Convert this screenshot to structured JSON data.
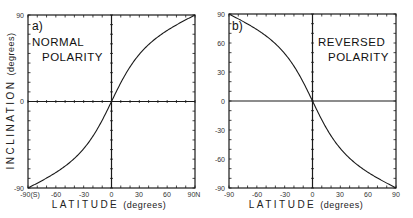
{
  "chart_data": [
    {
      "type": "line",
      "panel_label": "a)",
      "title_line1": "NORMAL",
      "title_line2": "POLARITY",
      "xlabel": "LATITUDE",
      "xlabel_unit": "(degrees)",
      "ylabel": "INCLINATION",
      "ylabel_unit": "(degrees)",
      "xlim": [
        -90,
        90
      ],
      "ylim": [
        -90,
        90
      ],
      "x_ticks": [
        "-90(S)",
        "-60",
        "-30",
        "0",
        "30",
        "60",
        "90N"
      ],
      "y_ticks": [
        "90",
        "0",
        "-90"
      ],
      "relation": "tan(I) = 2 tan(latitude)",
      "x": [
        -90,
        -75,
        -60,
        -45,
        -30,
        -15,
        0,
        15,
        30,
        45,
        60,
        75,
        90
      ],
      "y": [
        -90,
        -82.4,
        -73.9,
        -63.4,
        -49.1,
        -28.2,
        0,
        28.2,
        49.1,
        63.4,
        73.9,
        82.4,
        90
      ]
    },
    {
      "type": "line",
      "panel_label": "b)",
      "title_line1": "REVERSED",
      "title_line2": "POLARITY",
      "xlabel": "LATITUDE",
      "xlabel_unit": "(degrees)",
      "xlim": [
        -90,
        90
      ],
      "ylim": [
        -90,
        90
      ],
      "x_ticks": [
        "-90",
        "-60",
        "-30",
        "0",
        "30",
        "60",
        "90"
      ],
      "y_ticks": [
        "90",
        "60",
        "30",
        "0",
        "-30",
        "-60",
        "-90"
      ],
      "relation": "tan(I) = -2 tan(latitude)",
      "x": [
        -90,
        -75,
        -60,
        -45,
        -30,
        -15,
        0,
        15,
        30,
        45,
        60,
        75,
        90
      ],
      "y": [
        90,
        82.4,
        73.9,
        63.4,
        49.1,
        28.2,
        0,
        -28.2,
        -49.1,
        -63.4,
        -73.9,
        -82.4,
        -90
      ]
    }
  ],
  "left": {
    "panel_label": "a)",
    "title_line1": "NORMAL",
    "title_line2": "POLARITY",
    "ylabel": "INCLINATION",
    "ylabel_unit": "(degrees)",
    "xlabel": "LATITUDE",
    "xlabel_unit": "(degrees)",
    "y_ticks": [
      "90",
      "0",
      "-90"
    ],
    "x_ticks": [
      "-90(S)",
      "-60",
      "-30",
      "0",
      "30",
      "60",
      "90N"
    ]
  },
  "right": {
    "panel_label": "b)",
    "title_line1": "REVERSED",
    "title_line2": "POLARITY",
    "xlabel": "LATITUDE",
    "xlabel_unit": "(degrees)",
    "y_ticks": [
      "90",
      "60",
      "30",
      "0",
      "-30",
      "-60",
      "-90"
    ],
    "x_ticks": [
      "-90",
      "-60",
      "-30",
      "0",
      "30",
      "60",
      "90"
    ]
  }
}
